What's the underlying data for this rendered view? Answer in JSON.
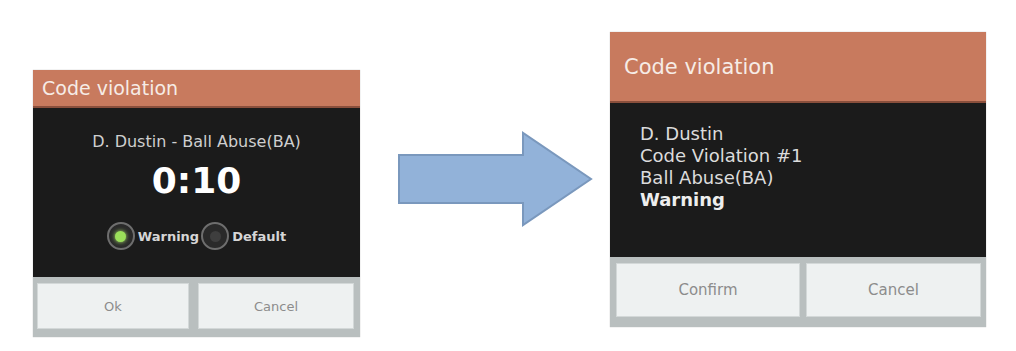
{
  "before_dialog": {
    "title": "Code violation",
    "subtitle": "D. Dustin - Ball Abuse(BA)",
    "timer": "0:10",
    "options": [
      {
        "label": "Warning",
        "selected": true
      },
      {
        "label": "Default",
        "selected": false
      }
    ],
    "buttons": {
      "ok": "Ok",
      "cancel": "Cancel"
    }
  },
  "arrow": {
    "direction": "right",
    "color": "#92b2d9",
    "border": "#7a98bd"
  },
  "after_dialog": {
    "title": "Code violation",
    "lines": {
      "player": "D. Dustin",
      "violation_number": "Code Violation #1",
      "violation_type": "Ball Abuse(BA)",
      "penalty": "Warning"
    },
    "buttons": {
      "confirm": "Confirm",
      "cancel": "Cancel"
    }
  },
  "colors": {
    "header": "#c87a5e",
    "body": "#1b1b1b",
    "footer": "#b9bfbf",
    "button": "#eef1f1",
    "radio_selected": "#9be05a"
  }
}
